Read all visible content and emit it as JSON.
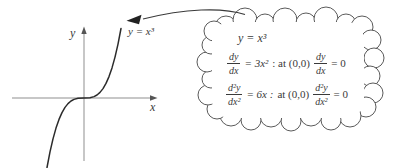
{
  "figure": {
    "background": "#ffffff",
    "ink_color": "#3a3a3a",
    "axis_color": "#8f8f8f",
    "curve_color": "#2b2b2b",
    "cloud_stroke_color": "#5a5a5a"
  },
  "graph": {
    "y_axis_label": "y",
    "x_axis_label": "x",
    "curve_label": "y = x³"
  },
  "cloud": {
    "line1": "y = x³",
    "line2": {
      "frac1_num": "dy",
      "frac1_den": "dx",
      "eq": "= 3x²",
      "cond": ": at (0,0)",
      "frac2_num": "dy",
      "frac2_den": "dx",
      "end": "= 0"
    },
    "line3": {
      "frac1_num": "d²y",
      "frac1_den": "dx²",
      "eq": "= 6x :",
      "cond": "at (0,0)",
      "frac2_num": "d²y",
      "frac2_den": "dx²",
      "end": "= 0"
    }
  }
}
